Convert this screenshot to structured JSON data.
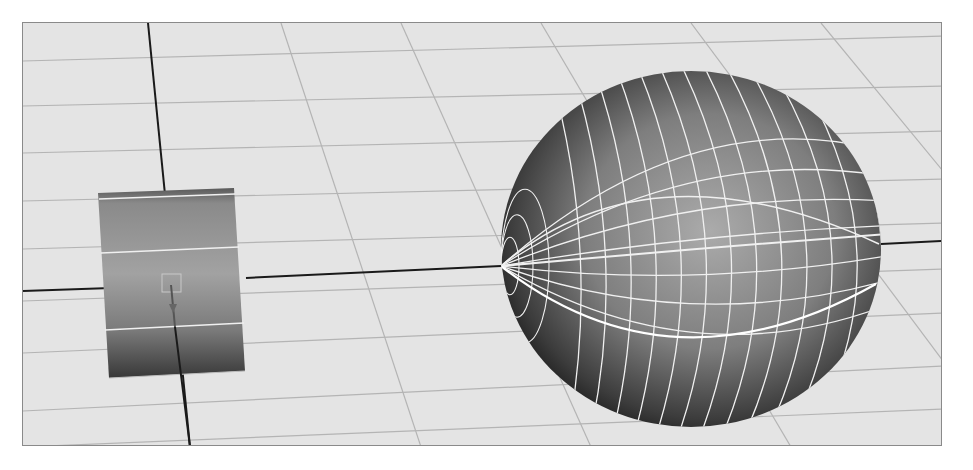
{
  "viewport": {
    "width": 973,
    "height": 470,
    "frame": {
      "x": 22,
      "y": 22,
      "w": 920,
      "h": 424
    },
    "colors": {
      "background": "#ffffff",
      "floor": "#e4e4e4",
      "frame_border": "#8a8a8a",
      "grid_line": "#b4b4b4",
      "axis_line": "#1a1a1a",
      "wireframe": "#f0f0f0",
      "surface_light": "#a6a6a6",
      "surface_mid": "#7a7a7a",
      "surface_dark": "#2e2e2e"
    }
  },
  "scene": {
    "grid": {
      "horizontal": [
        [
          22,
          60,
          942,
          35
        ],
        [
          22,
          105,
          942,
          85
        ],
        [
          22,
          152,
          942,
          130
        ],
        [
          22,
          200,
          942,
          178
        ],
        [
          22,
          248,
          942,
          222
        ],
        [
          22,
          300,
          942,
          268
        ],
        [
          22,
          352,
          942,
          312
        ],
        [
          22,
          410,
          942,
          365
        ],
        [
          22,
          446,
          942,
          408
        ]
      ],
      "vertical": [
        [
          280,
          22,
          420,
          446
        ],
        [
          400,
          22,
          590,
          446
        ],
        [
          540,
          22,
          790,
          446
        ],
        [
          690,
          22,
          942,
          360
        ],
        [
          820,
          22,
          942,
          170
        ]
      ]
    },
    "axes": {
      "z_axis": [
        147,
        22,
        189,
        446
      ],
      "x_axis_left": [
        22,
        290,
        110,
        287
      ],
      "x_axis_mid": [
        245,
        277,
        500,
        265
      ],
      "x_axis_right": [
        880,
        243,
        942,
        240
      ]
    },
    "cylinder": {
      "label": "cylinder-object",
      "top_left": [
        97,
        192
      ],
      "top_right": [
        233,
        187
      ],
      "bottom_right": [
        244,
        370
      ],
      "bottom_left": [
        108,
        377
      ],
      "ring_lines": [
        [
          98,
          198,
          234,
          193
        ],
        [
          100,
          252,
          238,
          246
        ],
        [
          104,
          329,
          243,
          322
        ]
      ],
      "pivot_box": {
        "x": 161,
        "y": 273,
        "w": 19,
        "h": 18
      }
    },
    "sphere": {
      "label": "sphere-object",
      "cx": 690,
      "cy": 248,
      "rx": 190,
      "ry": 178,
      "longitudes": 14,
      "latitudes": 8
    }
  }
}
